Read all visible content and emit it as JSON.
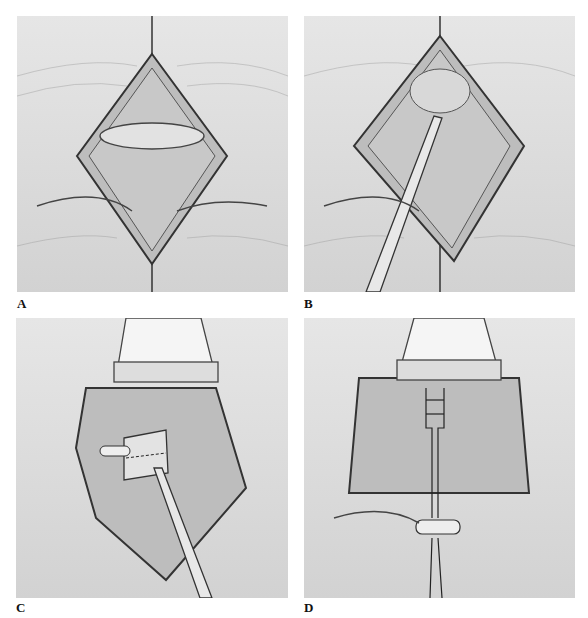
{
  "figure": {
    "panels": [
      {
        "id": "A",
        "label": "A",
        "description": "Eyelid incision opened showing diamond-shaped wound with horizontal elliptical tissue"
      },
      {
        "id": "B",
        "label": "B",
        "description": "Diamond-shaped incision with forceps instrument inserted"
      },
      {
        "id": "C",
        "label": "C",
        "description": "Retractor at top, forceps holding tissue block with dashed line"
      },
      {
        "id": "D",
        "label": "D",
        "description": "Retractor at top, sutures passed through tissue and tied over bolster below lid"
      }
    ]
  }
}
